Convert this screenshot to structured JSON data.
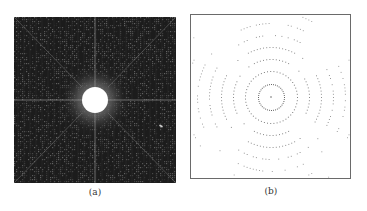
{
  "figure": {
    "panels": [
      {
        "id": "a",
        "caption": "(a)",
        "description": "Dark noisy diffraction-pattern image with bright central disk, horizontal/vertical grid lines and diagonal streaks",
        "colors": {
          "background": "#1c1c1c",
          "noise": "#5a5a5a",
          "grid_line": "#9a9a9a",
          "center_disk": "#ffffff",
          "halo": "#6e6e6e"
        }
      },
      {
        "id": "b",
        "caption": "(b)",
        "description": "White background with concentric rings of dotted points around a central point",
        "colors": {
          "background": "#ffffff",
          "border": "#6a6a6a",
          "dots": "#555555"
        },
        "ring_radii_px": [
          13,
          26,
          38,
          50,
          62,
          74,
          86,
          98,
          110
        ]
      }
    ]
  }
}
